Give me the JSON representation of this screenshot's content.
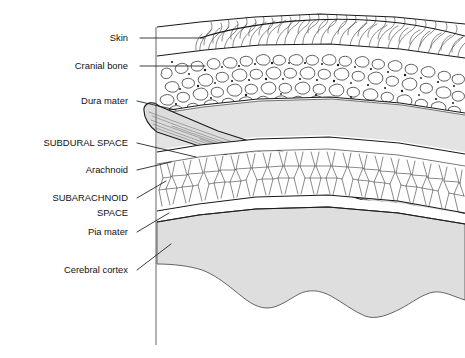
{
  "figure": {
    "width": 465,
    "height": 358,
    "background_color": "#ffffff",
    "caption": "",
    "ink_color": "#1a1a1a"
  },
  "labels": [
    {
      "id": "skin",
      "text": "Skin",
      "style": "sentence-case",
      "text_x": 128,
      "text_y": 41,
      "leader_points": "140,38 204,38"
    },
    {
      "id": "cranial-bone",
      "text": "Cranial bone",
      "style": "sentence-case",
      "text_x": 128,
      "text_y": 69,
      "leader_points": "140,66 203,66"
    },
    {
      "id": "dura-mater",
      "text": "Dura mater",
      "style": "sentence-case",
      "text_x": 128,
      "text_y": 104,
      "leader_points": "137,101 178,111"
    },
    {
      "id": "subdural-space",
      "text": "SUBDURAL SPACE",
      "style": "uppercase",
      "text_x": 128,
      "text_y": 146,
      "leader_points": "137,143 196,157"
    },
    {
      "id": "arachnoid",
      "text": "Arachnoid",
      "style": "sentence-case",
      "text_x": 128,
      "text_y": 173,
      "leader_points": "137,170 170,163"
    },
    {
      "id": "subarachnoid",
      "text": "SUBARACHNOID",
      "style": "uppercase",
      "text_x": 128,
      "text_y": 201,
      "leader_points": "137,198 165,182"
    },
    {
      "id": "space",
      "text": "SPACE",
      "style": "uppercase",
      "text_x": 128,
      "text_y": 216,
      "leader_points": ""
    },
    {
      "id": "pia-mater",
      "text": "Pia mater",
      "style": "sentence-case",
      "text_x": 128,
      "text_y": 235,
      "leader_points": "137,232 168,212"
    },
    {
      "id": "cerebral-cortex",
      "text": "Cerebral cortex",
      "style": "sentence-case",
      "text_x": 128,
      "text_y": 273,
      "leader_points": "137,270 170,245"
    }
  ],
  "layers": [
    {
      "id": "skin",
      "name": "Skin",
      "fill": "#ffffff",
      "texture": "hair-strands"
    },
    {
      "id": "cranial-bone",
      "name": "Cranial bone",
      "fill": "#ffffff",
      "texture": "trabecular-bone-cells"
    },
    {
      "id": "subdural-space",
      "name": "Subdural space",
      "fill": "#e3e3e3",
      "texture": "plain"
    },
    {
      "id": "dura-mater",
      "name": "Dura mater",
      "fill": "#dcdcdc",
      "texture": "fiber-lines"
    },
    {
      "id": "arachnoid",
      "name": "Arachnoid",
      "fill": "#ffffff",
      "texture": "plain"
    },
    {
      "id": "subarachnoid-space",
      "name": "Subarachnoid space",
      "fill": "#ffffff",
      "texture": "trabecular-web"
    },
    {
      "id": "pia-mater",
      "name": "Pia mater",
      "fill": "#ffffff",
      "texture": "plain"
    },
    {
      "id": "cerebral-cortex",
      "name": "Cerebral cortex",
      "fill": "#dedede",
      "texture": "plain"
    }
  ]
}
